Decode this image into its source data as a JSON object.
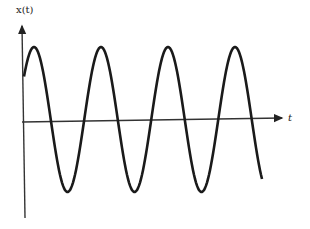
{
  "diagram": {
    "title": "",
    "y_axis_label": "x(t)",
    "x_axis_label": "t",
    "colors": {
      "line": "#1a1a1a",
      "axis": "#333333",
      "background": "#ffffff"
    }
  },
  "chart_data": {
    "type": "line",
    "title": "",
    "xlabel": "t",
    "ylabel": "x(t)",
    "grid": false,
    "series": [
      {
        "name": "x(t)",
        "function": "sinusoid",
        "periods_shown": 3.6,
        "peaks_visible": 4,
        "troughs_visible": 3
      }
    ]
  }
}
